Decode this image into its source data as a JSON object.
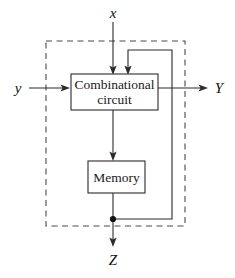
{
  "figure": {
    "kind": "block-diagram",
    "background_color": "#ffffff",
    "line_color": "#2b2b2b",
    "boundary_color": "#4a4a4a"
  },
  "blocks": {
    "combinational": {
      "label_line1": "Combinational",
      "label_line2": "circuit",
      "x": 71,
      "y": 74,
      "width": 87,
      "height": 36
    },
    "memory": {
      "label": "Memory",
      "x": 88,
      "y": 161,
      "width": 57,
      "height": 32
    }
  },
  "boundary": {
    "label": "circuit-boundary",
    "x": 46,
    "y": 41,
    "width": 139,
    "height": 185
  },
  "signals": {
    "input_x": "x",
    "input_y": "y",
    "output_Y": "Y",
    "output_Z": "Z"
  },
  "connections": [
    {
      "name": "x-to-combinational",
      "from": "x",
      "to": "combinational circuit",
      "direction": "down"
    },
    {
      "name": "y-to-combinational",
      "from": "y",
      "to": "combinational circuit",
      "direction": "right"
    },
    {
      "name": "combinational-to-Y",
      "from": "combinational circuit",
      "to": "Y",
      "direction": "right"
    },
    {
      "name": "combinational-to-memory",
      "from": "combinational circuit",
      "to": "memory",
      "direction": "down"
    },
    {
      "name": "memory-to-Z",
      "from": "memory",
      "to": "Z",
      "direction": "down"
    },
    {
      "name": "memory-feedback-to-combinational",
      "from": "memory",
      "to": "combinational circuit",
      "direction": "feedback"
    }
  ]
}
